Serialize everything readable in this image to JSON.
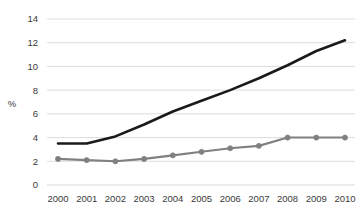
{
  "chart_data": {
    "type": "line",
    "title": "",
    "xlabel": "",
    "ylabel": "%",
    "ylim": [
      0,
      14
    ],
    "ytick_step": 2,
    "yticks": [
      "0",
      "2",
      "4",
      "6",
      "8",
      "10",
      "12",
      "14"
    ],
    "grid": "horizontal",
    "legend": "none",
    "categories": [
      "2000",
      "2001",
      "2002",
      "2003",
      "2004",
      "2005",
      "2006",
      "2007",
      "2008",
      "2009",
      "2010"
    ],
    "series": [
      {
        "name": "black-line",
        "color": "#1a1a1a",
        "markers": false,
        "values": [
          3.5,
          3.5,
          4.1,
          5.1,
          6.2,
          7.1,
          8.0,
          9.0,
          10.1,
          11.3,
          12.2
        ]
      },
      {
        "name": "gray-line",
        "color": "#808080",
        "markers": true,
        "values": [
          2.2,
          2.1,
          2.0,
          2.2,
          2.5,
          2.8,
          3.1,
          3.3,
          4.0,
          4.0,
          4.0
        ]
      }
    ],
    "colors": {
      "background": "#ffffff",
      "gridline": "#d9d9d9",
      "tick_label": "#3a3a3a",
      "black_series": "#1a1a1a",
      "gray_series": "#808080"
    }
  }
}
